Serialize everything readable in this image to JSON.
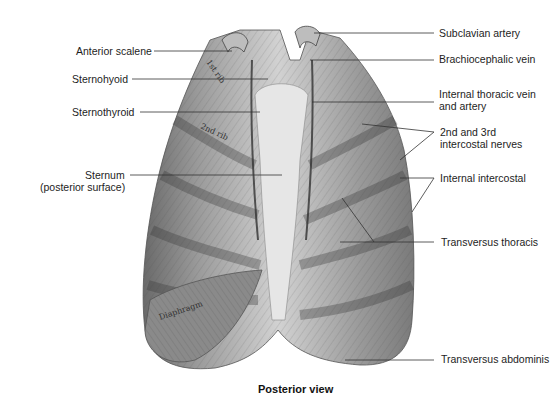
{
  "figure": {
    "caption": "Posterior view",
    "illustration_text": {
      "rib1": "1st rib",
      "rib2": "2nd rib",
      "diaphragm": "Diaphragm"
    },
    "labels_left": [
      {
        "id": "anterior-scalene",
        "text": "Anterior scalene"
      },
      {
        "id": "sternohyoid",
        "text": "Sternohyoid"
      },
      {
        "id": "sternothyroid",
        "text": "Sternothyroid"
      },
      {
        "id": "sternum",
        "text": "Sternum",
        "text2": "(posterior surface)"
      }
    ],
    "labels_right": [
      {
        "id": "subclavian-artery",
        "text": "Subclavian artery"
      },
      {
        "id": "brachiocephalic-vein",
        "text": "Brachiocephalic vein"
      },
      {
        "id": "internal-thoracic",
        "text": "Internal thoracic vein",
        "text2": "and artery"
      },
      {
        "id": "intercostal-nerves",
        "text": "2nd and 3rd",
        "text2": "intercostal nerves"
      },
      {
        "id": "internal-intercostal",
        "text": "Internal intercostal"
      },
      {
        "id": "transversus-thoracis",
        "text": "Transversus thoracis"
      },
      {
        "id": "transversus-abdominis",
        "text": "Transversus abdominis"
      }
    ]
  }
}
